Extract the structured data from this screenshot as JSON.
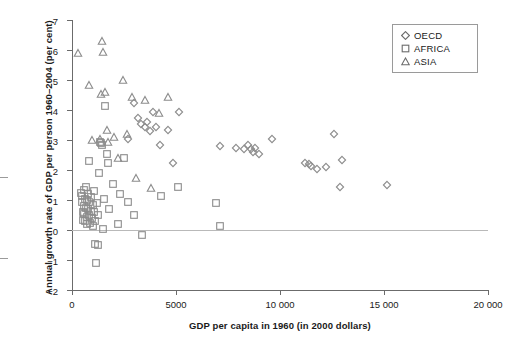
{
  "chart_data": {
    "type": "scatter",
    "title": "",
    "xlabel": "GDP per capita in 1960 (in 2000 dollars)",
    "ylabel": "Annual growth rate of GDP per person 1960–2004 (per cent)",
    "xlim": [
      0,
      20000
    ],
    "ylim": [
      -2,
      7
    ],
    "xticks": [
      0,
      5000,
      10000,
      15000,
      20000
    ],
    "xticklabels": [
      "0",
      "5000",
      "10 000",
      "15 000",
      "20 000"
    ],
    "yticks": [
      -2,
      -1,
      0,
      1,
      2,
      3,
      4,
      5,
      6,
      7
    ],
    "yticklabels": [
      "−2",
      "−1",
      "0",
      "1",
      "2",
      "3",
      "4",
      "5",
      "6",
      "7"
    ],
    "grid": false,
    "zero_reference_line": true,
    "legend_position": "top-right",
    "series": [
      {
        "name": "OECD",
        "marker": "diamond",
        "points": [
          [
            2700,
            3.05
          ],
          [
            3000,
            4.25
          ],
          [
            3150,
            3.75
          ],
          [
            3300,
            3.55
          ],
          [
            3500,
            3.45
          ],
          [
            3600,
            3.6
          ],
          [
            3750,
            3.3
          ],
          [
            3900,
            3.95
          ],
          [
            4050,
            3.45
          ],
          [
            4250,
            2.85
          ],
          [
            4600,
            3.35
          ],
          [
            5150,
            3.95
          ],
          [
            4850,
            2.25
          ],
          [
            7100,
            2.8
          ],
          [
            7900,
            2.75
          ],
          [
            8250,
            2.7
          ],
          [
            8450,
            2.85
          ],
          [
            8600,
            2.7
          ],
          [
            8700,
            2.6
          ],
          [
            8800,
            2.75
          ],
          [
            9000,
            2.55
          ],
          [
            9600,
            3.05
          ],
          [
            11200,
            2.25
          ],
          [
            11400,
            2.2
          ],
          [
            11500,
            2.15
          ],
          [
            11800,
            2.05
          ],
          [
            12200,
            2.1
          ],
          [
            12600,
            3.2
          ],
          [
            13000,
            2.35
          ],
          [
            12900,
            1.45
          ],
          [
            15150,
            1.5
          ]
        ]
      },
      {
        "name": "AFRICA",
        "marker": "square",
        "points": [
          [
            430,
            1.25
          ],
          [
            460,
            0.95
          ],
          [
            500,
            1.15
          ],
          [
            520,
            0.6
          ],
          [
            540,
            0.35
          ],
          [
            560,
            1.35
          ],
          [
            580,
            0.8
          ],
          [
            600,
            0.55
          ],
          [
            620,
            1.05
          ],
          [
            640,
            0.3
          ],
          [
            660,
            0.75
          ],
          [
            680,
            1.45
          ],
          [
            700,
            0.45
          ],
          [
            720,
            1.0
          ],
          [
            740,
            0.2
          ],
          [
            760,
            0.7
          ],
          [
            790,
            1.2
          ],
          [
            810,
            0.5
          ],
          [
            840,
            0.95
          ],
          [
            870,
            0.25
          ],
          [
            900,
            0.65
          ],
          [
            930,
            1.1
          ],
          [
            960,
            0.4
          ],
          [
            990,
            0.85
          ],
          [
            1020,
            0.15
          ],
          [
            1050,
            1.3
          ],
          [
            1080,
            0.6
          ],
          [
            1120,
            0.3
          ],
          [
            1180,
            0.9
          ],
          [
            1240,
            0.5
          ],
          [
            1300,
            1.9
          ],
          [
            1350,
            2.95
          ],
          [
            1400,
            2.9
          ],
          [
            1450,
            2.85
          ],
          [
            1600,
            4.15
          ],
          [
            1700,
            2.55
          ],
          [
            1750,
            2.25
          ],
          [
            1800,
            0.7
          ],
          [
            1500,
            0.05
          ],
          [
            1100,
            -0.45
          ],
          [
            1250,
            -0.5
          ],
          [
            1150,
            -1.1
          ],
          [
            2300,
            1.2
          ],
          [
            2500,
            2.4
          ],
          [
            2700,
            0.95
          ],
          [
            3000,
            0.5
          ],
          [
            3350,
            -0.15
          ],
          [
            2200,
            0.2
          ],
          [
            1950,
            1.55
          ],
          [
            6900,
            0.9
          ],
          [
            5100,
            1.45
          ],
          [
            7100,
            0.15
          ],
          [
            4300,
            1.15
          ],
          [
            820,
            2.3
          ],
          [
            1550,
            1.05
          ]
        ]
      },
      {
        "name": "ASIA",
        "marker": "triangle",
        "points": [
          [
            300,
            5.9
          ],
          [
            800,
            4.85
          ],
          [
            1450,
            6.3
          ],
          [
            1500,
            5.95
          ],
          [
            1600,
            4.6
          ],
          [
            1400,
            4.55
          ],
          [
            1350,
            3.05
          ],
          [
            1700,
            3.35
          ],
          [
            2000,
            3.1
          ],
          [
            2200,
            2.4
          ],
          [
            2450,
            5.0
          ],
          [
            2900,
            4.45
          ],
          [
            3100,
            1.75
          ],
          [
            3500,
            4.35
          ],
          [
            3800,
            1.4
          ],
          [
            4200,
            3.9
          ],
          [
            4600,
            4.45
          ],
          [
            1750,
            2.95
          ],
          [
            2650,
            3.2
          ],
          [
            950,
            3.0
          ]
        ]
      }
    ]
  },
  "legend": {
    "items": [
      {
        "label": "OECD",
        "marker": "diamond"
      },
      {
        "label": "AFRICA",
        "marker": "square"
      },
      {
        "label": "ASIA",
        "marker": "triangle"
      }
    ]
  },
  "colors": {
    "marker_stroke": "#8c8c8c",
    "axis": "#6b6b6b",
    "zero_line": "#b9b9b9",
    "text": "#1a1a1a",
    "background": "#ffffff"
  }
}
